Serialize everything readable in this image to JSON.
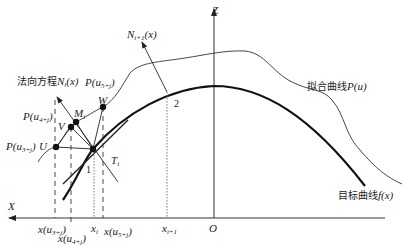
{
  "diagram": {
    "axes": {
      "x_label": "X",
      "z_label": "Z",
      "origin_label": "O"
    },
    "curves": {
      "fitted": {
        "label_cn": "拟合曲线",
        "label_fn": "P(u)"
      },
      "target": {
        "label_cn": "目标曲线",
        "label_fn": "f(x)"
      }
    },
    "normals": {
      "n_i": {
        "label_cn": "法向方程",
        "label_fn": "N",
        "sub": "i",
        "arg": "(x)"
      },
      "n_i1": {
        "label_fn": "N",
        "sub": "i+1",
        "arg": "(x)"
      }
    },
    "points": {
      "U": "U",
      "V": "V",
      "W": "W",
      "M": "M",
      "M_sub": "i",
      "T": "T",
      "T_sub": "i"
    },
    "point_labels": {
      "p3": {
        "fn": "P(u",
        "sub": "3+j",
        "close": ")"
      },
      "p4": {
        "fn": "P(u",
        "sub": "4+j",
        "close": ")"
      },
      "p5": {
        "fn": "P(u",
        "sub": "5+j",
        "close": ")"
      }
    },
    "x_ticks": {
      "xu3": {
        "fn": "x(u",
        "sub": "3+j",
        "close": ")"
      },
      "xu4": {
        "fn": "x(u",
        "sub": "4+j",
        "close": ")"
      },
      "xi": {
        "fn": "x",
        "sub": "i"
      },
      "xu5": {
        "fn": "x(u",
        "sub": "5+j",
        "close": ")"
      },
      "xi1": {
        "fn": "x",
        "sub": "i+1"
      }
    },
    "markers": {
      "one": "1",
      "two": "2"
    },
    "colors": {
      "line": "#222222",
      "background": "#ffffff"
    }
  }
}
